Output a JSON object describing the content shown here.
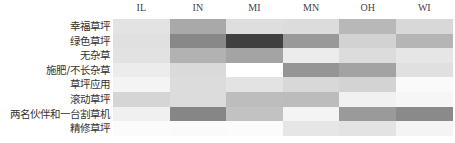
{
  "chart_data": {
    "type": "heatmap",
    "title": "",
    "xlabel": "",
    "ylabel": "",
    "columns": [
      "IL",
      "IN",
      "MI",
      "MN",
      "OH",
      "WI"
    ],
    "rows": [
      "幸福草坪",
      "绿色草坪",
      "无杂草",
      "施肥/不长杂草",
      "草坪应用",
      "滚动草坪",
      "两名伙伴和一台割草机",
      "精修草坪"
    ],
    "values": [
      [
        11,
        34,
        13,
        14,
        28,
        15
      ],
      [
        12,
        47,
        75,
        40,
        18,
        29
      ],
      [
        11,
        30,
        36,
        7,
        14,
        10
      ],
      [
        7,
        15,
        0,
        42,
        36,
        12
      ],
      [
        4,
        14,
        11,
        15,
        17,
        2
      ],
      [
        17,
        14,
        26,
        26,
        5,
        3
      ],
      [
        6,
        48,
        24,
        4,
        40,
        46
      ],
      [
        2,
        2,
        2,
        10,
        11,
        4
      ]
    ],
    "colors": [
      [
        "#e3e3e3",
        "#a9a9a9",
        "#dedede",
        "#dcdcdc",
        "#b8b8b8",
        "#d8d8d8"
      ],
      [
        "#e0e0e0",
        "#888888",
        "#404040",
        "#999999",
        "#d2d2d2",
        "#b5b5b5"
      ],
      [
        "#e2e2e2",
        "#b2b2b2",
        "#a4a4a4",
        "#ececec",
        "#dcdcdc",
        "#e6e6e6"
      ],
      [
        "#ececec",
        "#dadada",
        "#ffffff",
        "#959595",
        "#a3a3a3",
        "#e0e0e0"
      ],
      [
        "#f4f4f4",
        "#dcdcdc",
        "#e3e3e3",
        "#d8d8d8",
        "#d3d3d3",
        "#fafafa"
      ],
      [
        "#d5d5d5",
        "#dcdcdc",
        "#bdbdbd",
        "#bcbcbc",
        "#f1f1f1",
        "#f6f6f6"
      ],
      [
        "#f0f0f0",
        "#868686",
        "#c2c2c2",
        "#f4f4f4",
        "#9a9a9a",
        "#8a8a8a"
      ],
      [
        "#fbfbfb",
        "#fafafa",
        "#fbfbfb",
        "#e6e6e6",
        "#e3e3e3",
        "#f4f4f4"
      ]
    ],
    "colormap": "grayscale (darker = higher)",
    "legend": "none",
    "grid": false
  }
}
